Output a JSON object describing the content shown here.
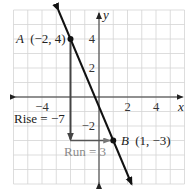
{
  "figure": {
    "title": "",
    "x_axis_label": "x",
    "y_axis_label": "y",
    "x_range": [
      -6,
      6
    ],
    "y_range": [
      -6,
      6
    ],
    "grid_step": 1,
    "x_tick_labels": [
      {
        "value": -4,
        "text": "−4"
      },
      {
        "value": 2,
        "text": "2"
      },
      {
        "value": 4,
        "text": "4"
      }
    ],
    "y_tick_labels": [
      {
        "value": 4,
        "text": "4"
      },
      {
        "value": 2,
        "text": "2"
      },
      {
        "value": -2,
        "text": "−2"
      }
    ],
    "points": [
      {
        "name": "A",
        "x": -2,
        "y": 4,
        "label": "(−2, 4)"
      },
      {
        "name": "B",
        "x": 1,
        "y": -3,
        "label": "(1, −3)"
      }
    ],
    "line": {
      "through": [
        "A",
        "B"
      ],
      "slope": "-7/3",
      "color": "#111111"
    },
    "rise": {
      "text": "Rise = −7",
      "value": -7,
      "color": "#444444"
    },
    "run": {
      "text": "Run = 3",
      "value": 3,
      "color": "#8a8a8a"
    }
  },
  "chart_data": {
    "type": "line",
    "title": "",
    "xlabel": "x",
    "ylabel": "y",
    "xlim": [
      -6,
      6
    ],
    "ylim": [
      -6,
      6
    ],
    "grid": true,
    "series": [
      {
        "name": "line AB",
        "x": [
          -2,
          1
        ],
        "y": [
          4,
          -3
        ]
      }
    ],
    "annotations": [
      "A (−2, 4)",
      "B (1, −3)",
      "Rise = −7",
      "Run = 3"
    ],
    "x_ticks": [
      "−4",
      "2",
      "4"
    ],
    "y_ticks": [
      "4",
      "2",
      "−2"
    ]
  }
}
